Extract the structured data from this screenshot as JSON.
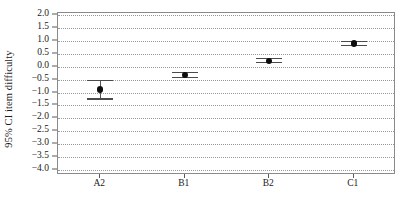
{
  "chart_data": {
    "type": "scatter",
    "title": "",
    "subtitle": "",
    "xlabel": "",
    "ylabel": "95% CI item difficulty",
    "categories": [
      "A2",
      "B1",
      "B2",
      "C1"
    ],
    "ylim": [
      -4.0,
      2.0
    ],
    "ytick_labels": [
      "2.0",
      "1.5",
      "1.0",
      "0.5",
      "0.0",
      "-0.5",
      "-1.0",
      "-1.5",
      "-2.0",
      "-2.5",
      "-3.0",
      "-3.5",
      "-4.0"
    ],
    "ytick_values": [
      2.0,
      1.5,
      1.0,
      0.5,
      0.0,
      -0.5,
      -1.0,
      -1.5,
      -2.0,
      -2.5,
      -3.0,
      -3.5,
      -4.0
    ],
    "grid": "horizontal-dotted",
    "legend": "none",
    "error_bar_type": "95% confidence interval",
    "series": [
      {
        "name": "95% CI item difficulty",
        "values": [
          -0.88,
          -0.33,
          0.23,
          0.9
        ],
        "ci_lower": [
          -1.28,
          -0.45,
          0.13,
          0.8
        ],
        "ci_upper": [
          -0.5,
          -0.2,
          0.35,
          1.0
        ]
      }
    ],
    "points": [
      {
        "category": "A2",
        "mean": -0.88,
        "lower": -1.28,
        "upper": -0.5
      },
      {
        "category": "B1",
        "mean": -0.33,
        "lower": -0.45,
        "upper": -0.2
      },
      {
        "category": "B2",
        "mean": 0.23,
        "lower": 0.13,
        "upper": 0.35
      },
      {
        "category": "C1",
        "mean": 0.9,
        "lower": 0.8,
        "upper": 1.0
      }
    ],
    "colors": {
      "marker": "#0d0d0d",
      "errorbar": "#4a4a4a",
      "grid": "#9a9a9a",
      "frame": "#8a8a8a",
      "background": "#ffffff",
      "text": "#1a1a1a"
    }
  }
}
